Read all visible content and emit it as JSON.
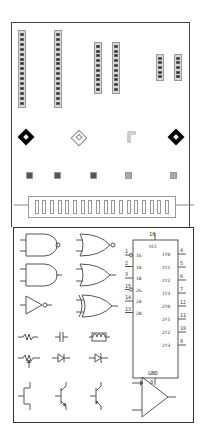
{
  "board": {
    "headers": [
      {
        "id": "h1",
        "pins": 15
      },
      {
        "id": "h2",
        "pins": 15
      },
      {
        "id": "h3",
        "pins": 10
      },
      {
        "id": "h4",
        "pins": 10
      },
      {
        "id": "h5",
        "pins": 5
      },
      {
        "id": "h6",
        "pins": 5
      }
    ],
    "slot_connector": {
      "slots": 18
    }
  },
  "ic": {
    "vcc_pin": "16",
    "vcc_label": "VCC",
    "gnd_pin": "8",
    "gnd_label": "GND",
    "left_pins": [
      {
        "num": "1",
        "label": "1G",
        "inverted": true
      },
      {
        "num": "2",
        "label": "1A",
        "inverted": false
      },
      {
        "num": "3",
        "label": "1B",
        "inverted": false
      },
      {
        "num": "15",
        "label": "2G",
        "inverted": true
      },
      {
        "num": "14",
        "label": "2A",
        "inverted": false
      },
      {
        "num": "13",
        "label": "2B",
        "inverted": false
      }
    ],
    "right_pins": [
      {
        "num": "4",
        "label": "1Y0"
      },
      {
        "num": "5",
        "label": "1Y1"
      },
      {
        "num": "6",
        "label": "1Y2"
      },
      {
        "num": "7",
        "label": "1Y3"
      },
      {
        "num": "12",
        "label": "2Y0"
      },
      {
        "num": "11",
        "label": "2Y1"
      },
      {
        "num": "10",
        "label": "2Y2"
      },
      {
        "num": "9",
        "label": "2Y3"
      }
    ]
  },
  "symbols": {
    "gates": [
      "NAND",
      "XNOR",
      "AND",
      "OR",
      "NOT",
      "XOR"
    ],
    "passives": [
      "resistor",
      "capacitor",
      "inductor",
      "potentiometer",
      "diode",
      "zener-diode"
    ],
    "transistors": [
      "jfet",
      "npn",
      "pnp"
    ],
    "amplifier": "op-amp"
  }
}
